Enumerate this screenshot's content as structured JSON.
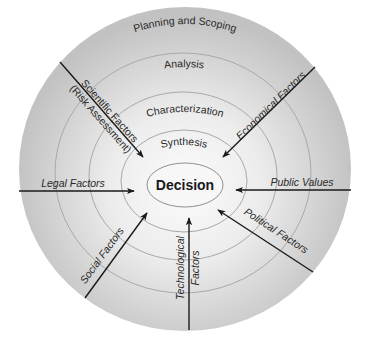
{
  "diagram": {
    "type": "concentric-process-diagram",
    "center": {
      "label": "Decision"
    },
    "rings": [
      {
        "label": "Synthesis",
        "order": 1
      },
      {
        "label": "Characterization",
        "order": 2
      },
      {
        "label": "Analysis",
        "order": 3
      },
      {
        "label": "Planning and Scoping",
        "order": 4
      }
    ],
    "inputs": [
      {
        "id": "scientific",
        "label_line1": "Scientific Factors",
        "label_line2": "(Risk Assessment)",
        "direction": "upper-left"
      },
      {
        "id": "economical",
        "label": "Economical Factors",
        "direction": "upper-right"
      },
      {
        "id": "legal",
        "label": "Legal Factors",
        "direction": "left"
      },
      {
        "id": "public",
        "label": "Public Values",
        "direction": "right"
      },
      {
        "id": "social",
        "label": "Social Factors",
        "direction": "lower-left"
      },
      {
        "id": "technological",
        "label_line1": "Technological",
        "label_line2": "Factors",
        "direction": "bottom"
      },
      {
        "id": "political",
        "label": "Political Factors",
        "direction": "lower-right"
      }
    ],
    "colors": {
      "disc_center": "#fbfbfb",
      "disc_edge": "#c4c4c4",
      "ring_stroke": "#a9a9a9",
      "arrow": "#1a1a1a",
      "text": "#2a2a2a"
    }
  }
}
